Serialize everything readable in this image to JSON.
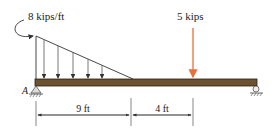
{
  "diagram": {
    "distributed_load": {
      "label": "8 kips/ft",
      "max_intensity": 8,
      "unit": "kips/ft"
    },
    "point_load": {
      "label": "5 kips",
      "value": 5,
      "color": "#e8703a"
    },
    "support_a": {
      "label": "A"
    },
    "dimensions": [
      {
        "label": "9 ft"
      },
      {
        "label": "4 ft"
      }
    ],
    "beam_color": "#6b5233"
  }
}
